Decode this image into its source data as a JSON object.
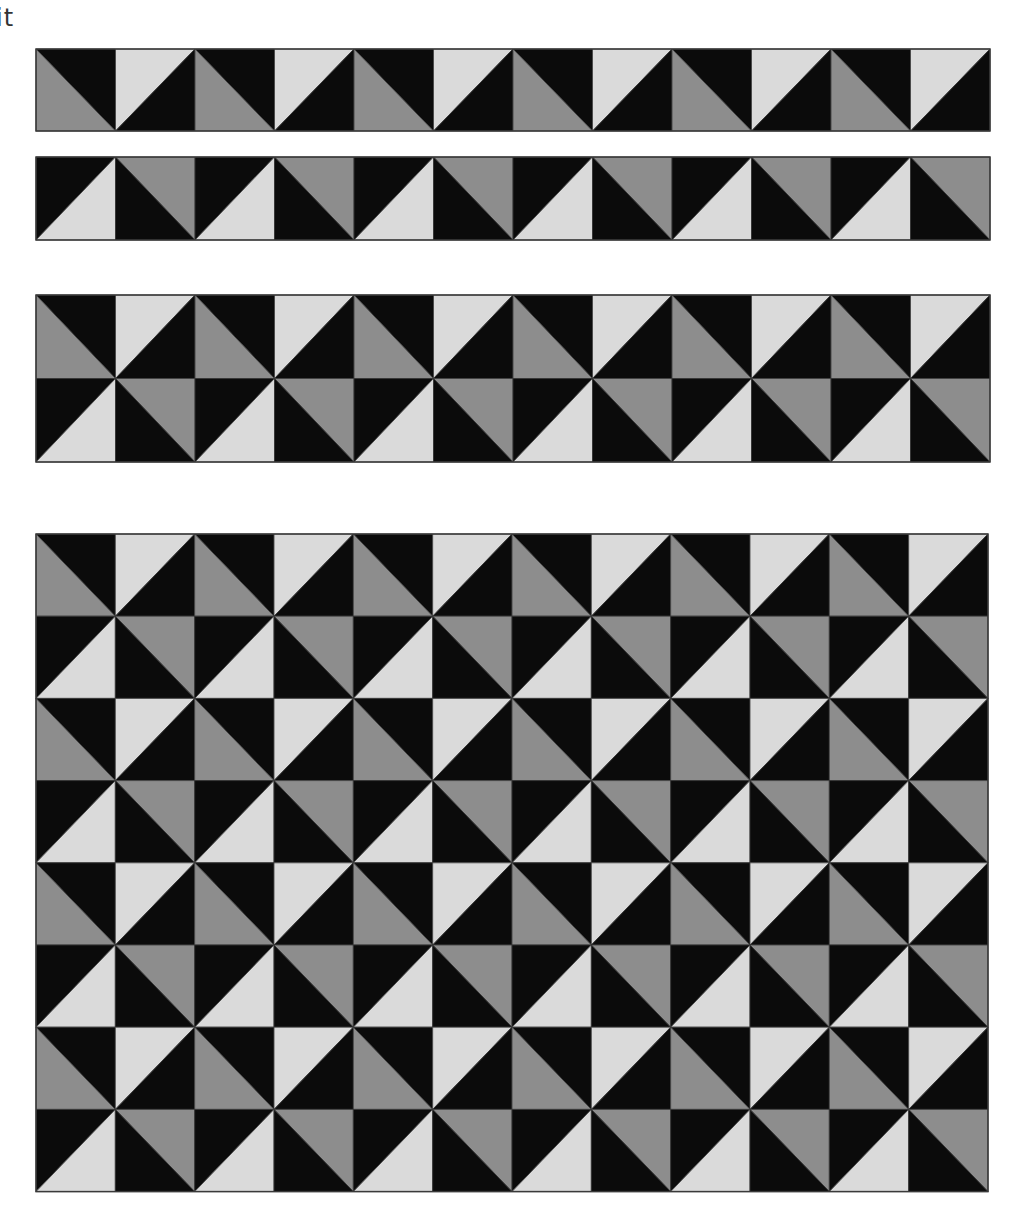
{
  "caption": "it",
  "colors": {
    "dark": "#0b0b0b",
    "mid": "#8d8d8d",
    "light": "#dadada",
    "line": "#3a3a3a"
  },
  "tiles": {
    "A1": {
      "diagonal": "tl-br",
      "upper": "dark",
      "lower": "mid",
      "description": "top-right black, bottom-left gray"
    },
    "A2": {
      "diagonal": "bl-tr",
      "upper": "light",
      "lower": "dark",
      "description": "top-left light, bottom-right black"
    },
    "B1": {
      "diagonal": "bl-tr",
      "upper": "dark",
      "lower": "light",
      "description": "top-left black, bottom-right light"
    },
    "B2": {
      "diagonal": "tl-br",
      "upper": "mid",
      "lower": "dark",
      "description": "top-right gray, bottom-left black"
    }
  },
  "row_patterns": {
    "A": [
      "A1",
      "A2"
    ],
    "B": [
      "B1",
      "B2"
    ]
  },
  "columns": 12,
  "blocks": [
    {
      "name": "strip-row-a",
      "x": 36,
      "y": 49,
      "width": 954,
      "row_height": 82,
      "rows": [
        "A"
      ]
    },
    {
      "name": "strip-row-b",
      "x": 36,
      "y": 157,
      "width": 954,
      "row_height": 83,
      "rows": [
        "B"
      ]
    },
    {
      "name": "strip-two-rows",
      "x": 36,
      "y": 295,
      "width": 954,
      "row_height": 83.5,
      "rows": [
        "A",
        "B"
      ]
    },
    {
      "name": "full-quilt-grid",
      "x": 36,
      "y": 534,
      "width": 952,
      "row_height": 82.2,
      "rows": [
        "A",
        "B",
        "A",
        "B",
        "A",
        "B",
        "A",
        "B"
      ]
    }
  ]
}
